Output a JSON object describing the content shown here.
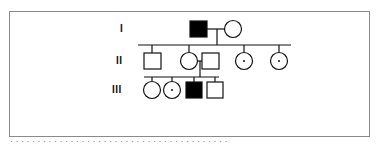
{
  "diagram": {
    "type": "pedigree",
    "colors": {
      "line": "#111111",
      "affected_fill": "#000000",
      "unaffected_fill": "#ffffff",
      "frame": "#8a8a8a"
    },
    "generations": [
      {
        "label": "I",
        "y": 29
      },
      {
        "label": "II",
        "y": 61
      },
      {
        "label": "III",
        "y": 90
      }
    ],
    "individuals": [
      {
        "id": "I-1",
        "gen": "I",
        "sex": "male",
        "status": "affected",
        "cx": 198,
        "cy": 29
      },
      {
        "id": "I-2",
        "gen": "I",
        "sex": "female",
        "status": "unaffected",
        "cx": 233,
        "cy": 29
      },
      {
        "id": "II-1",
        "gen": "II",
        "sex": "male",
        "status": "unaffected",
        "cx": 152,
        "cy": 61
      },
      {
        "id": "II-2",
        "gen": "II",
        "sex": "female",
        "status": "unaffected",
        "cx": 189,
        "cy": 61
      },
      {
        "id": "II-3",
        "gen": "II",
        "sex": "male",
        "status": "unaffected",
        "cx": 210,
        "cy": 61,
        "note": "spouse"
      },
      {
        "id": "II-4",
        "gen": "II",
        "sex": "female",
        "status": "carrier",
        "cx": 244,
        "cy": 61
      },
      {
        "id": "II-5",
        "gen": "II",
        "sex": "female",
        "status": "carrier",
        "cx": 279,
        "cy": 61
      },
      {
        "id": "III-1",
        "gen": "III",
        "sex": "female",
        "status": "unaffected",
        "cx": 152,
        "cy": 90
      },
      {
        "id": "III-2",
        "gen": "III",
        "sex": "female",
        "status": "carrier",
        "cx": 172,
        "cy": 90
      },
      {
        "id": "III-3",
        "gen": "III",
        "sex": "male",
        "status": "affected",
        "cx": 194,
        "cy": 90
      },
      {
        "id": "III-4",
        "gen": "III",
        "sex": "male",
        "status": "unaffected",
        "cx": 215,
        "cy": 90
      }
    ],
    "caption": "· · · · · ·  · ·  · · ·  · · · · ·  · · · · · · ·  · · · · ·  · · · · · ·  · · · · · ·"
  }
}
